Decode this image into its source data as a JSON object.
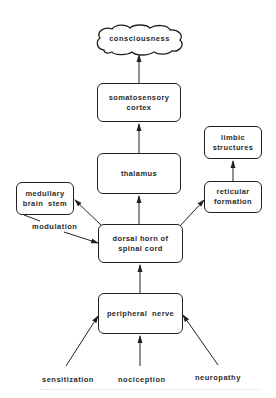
{
  "diagram": {
    "nodes": {
      "consciousness": "consciousness",
      "somatosensory_cortex": [
        "somatosensory",
        "cortex"
      ],
      "thalamus": "thalamus",
      "limbic_structures": [
        "limbic",
        "structures"
      ],
      "reticular_formation": [
        "reticular",
        "formation"
      ],
      "medullary_brain_stem": [
        "medullary",
        "brain  stem"
      ],
      "dorsal_horn": [
        "dorsal horn of",
        "spinal cord"
      ],
      "peripheral_nerve": "peripheral  nerve"
    },
    "labels": {
      "modulation": "modulation",
      "sensitization": "sensitization",
      "nociception": "nociception",
      "neuropathy": "neuropathy"
    },
    "edges": [
      {
        "from": "somatosensory_cortex",
        "to": "consciousness"
      },
      {
        "from": "thalamus",
        "to": "somatosensory_cortex"
      },
      {
        "from": "dorsal_horn",
        "to": "thalamus"
      },
      {
        "from": "dorsal_horn",
        "to": "medullary_brain_stem"
      },
      {
        "from": "dorsal_horn",
        "to": "reticular_formation"
      },
      {
        "from": "reticular_formation",
        "to": "limbic_structures"
      },
      {
        "from": "medullary_brain_stem",
        "to": "dorsal_horn",
        "label": "modulation"
      },
      {
        "from": "peripheral_nerve",
        "to": "dorsal_horn"
      },
      {
        "from": "sensitization",
        "to": "peripheral_nerve"
      },
      {
        "from": "nociception",
        "to": "peripheral_nerve"
      },
      {
        "from": "neuropathy",
        "to": "peripheral_nerve"
      }
    ]
  }
}
